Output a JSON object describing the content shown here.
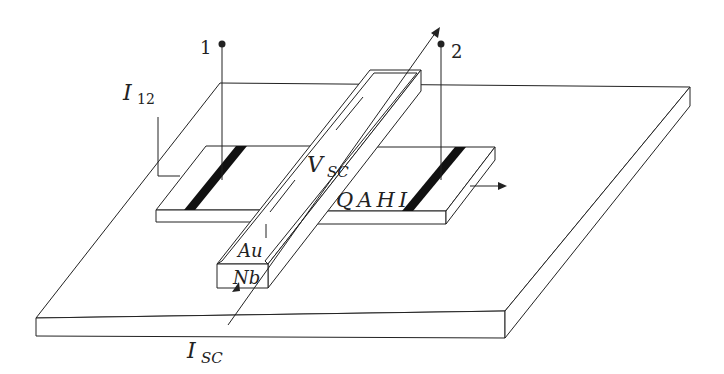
{
  "diagram": {
    "colors": {
      "line": "#222222",
      "stripe": "#111111",
      "background": "#ffffff"
    },
    "terminals": [
      {
        "id": "1",
        "label": "1"
      },
      {
        "id": "2",
        "label": "2"
      }
    ],
    "labels": {
      "i12_main": "I",
      "i12_sub": "12",
      "vsc_main": "V",
      "vsc_sub": "SC",
      "qahi": "QAHI",
      "au": "Au",
      "nb": "Nb",
      "isc_main": "I",
      "isc_sub": "SC"
    },
    "components": [
      {
        "name": "substrate",
        "type": "slab"
      },
      {
        "name": "qahi-left-pad",
        "type": "slab",
        "contact": "black stripe"
      },
      {
        "name": "qahi-right-pad",
        "type": "slab",
        "contact": "black stripe"
      },
      {
        "name": "nb-bar",
        "type": "bar",
        "coating": "Au"
      }
    ]
  }
}
